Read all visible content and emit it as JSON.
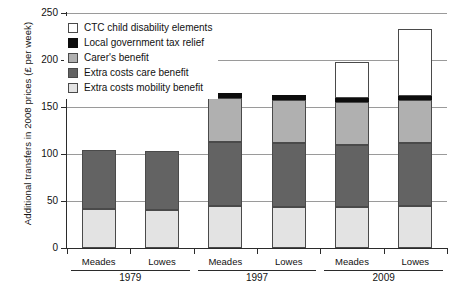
{
  "chart_data": {
    "type": "bar",
    "subtype": "stacked-bar-grouped",
    "title": "",
    "xlabel": "",
    "ylabel": "Additional transfers in 2008 prices (£ per week)",
    "ylim": [
      0,
      250
    ],
    "yticks": [
      0,
      50,
      100,
      150,
      200,
      250
    ],
    "ytick_labels": [
      "0",
      "50",
      "100",
      "150",
      "200",
      "250"
    ],
    "grid": true,
    "legend_position": "top-left-inside",
    "categories": [
      "Meades",
      "Lowes",
      "Meades",
      "Lowes",
      "Meades",
      "Lowes"
    ],
    "groups": [
      {
        "label": "1979",
        "categories": [
          "Meades",
          "Lowes"
        ]
      },
      {
        "label": "1997",
        "categories": [
          "Meades",
          "Lowes"
        ]
      },
      {
        "label": "2009",
        "categories": [
          "Meades",
          "Lowes"
        ]
      }
    ],
    "series": [
      {
        "name": "Extra costs mobility benefit",
        "color": "#e3e3e3",
        "values": [
          42,
          41,
          45,
          44,
          44,
          45
        ]
      },
      {
        "name": "Extra costs care benefit",
        "color": "#636363",
        "values": [
          62,
          62,
          68,
          68,
          66,
          67
        ]
      },
      {
        "name": "Carer's benefit",
        "color": "#b0b0b0",
        "values": [
          0,
          0,
          47,
          46,
          45,
          45
        ]
      },
      {
        "name": "Local government tax relief",
        "color": "#0d0d0d",
        "values": [
          0,
          0,
          5,
          5,
          5,
          5
        ]
      },
      {
        "name": "CTC child disability elements",
        "color": "#ffffff",
        "values": [
          0,
          0,
          0,
          0,
          38,
          71
        ]
      }
    ],
    "totals": [
      104,
      103,
      165,
      163,
      198,
      233
    ],
    "bars": [
      {
        "group": "1979",
        "category": "Meades",
        "total": 104,
        "segments": [
          {
            "name": "Extra costs mobility benefit",
            "value": 42,
            "from": 0,
            "to": 42
          },
          {
            "name": "Extra costs care benefit",
            "value": 62,
            "from": 42,
            "to": 104
          }
        ]
      },
      {
        "group": "1979",
        "category": "Lowes",
        "total": 103,
        "segments": [
          {
            "name": "Extra costs mobility benefit",
            "value": 41,
            "from": 0,
            "to": 41
          },
          {
            "name": "Extra costs care benefit",
            "value": 62,
            "from": 41,
            "to": 103
          }
        ]
      },
      {
        "group": "1997",
        "category": "Meades",
        "total": 165,
        "segments": [
          {
            "name": "Extra costs mobility benefit",
            "value": 45,
            "from": 0,
            "to": 45
          },
          {
            "name": "Extra costs care benefit",
            "value": 68,
            "from": 45,
            "to": 113
          },
          {
            "name": "Carer's benefit",
            "value": 47,
            "from": 113,
            "to": 160
          },
          {
            "name": "Local government tax relief",
            "value": 5,
            "from": 160,
            "to": 165
          }
        ]
      },
      {
        "group": "1997",
        "category": "Lowes",
        "total": 163,
        "segments": [
          {
            "name": "Extra costs mobility benefit",
            "value": 44,
            "from": 0,
            "to": 44
          },
          {
            "name": "Extra costs care benefit",
            "value": 68,
            "from": 44,
            "to": 112
          },
          {
            "name": "Carer's benefit",
            "value": 46,
            "from": 112,
            "to": 158
          },
          {
            "name": "Local government tax relief",
            "value": 5,
            "from": 158,
            "to": 163
          }
        ]
      },
      {
        "group": "2009",
        "category": "Meades",
        "total": 198,
        "segments": [
          {
            "name": "Extra costs mobility benefit",
            "value": 44,
            "from": 0,
            "to": 44
          },
          {
            "name": "Extra costs care benefit",
            "value": 66,
            "from": 44,
            "to": 110
          },
          {
            "name": "Carer's benefit",
            "value": 45,
            "from": 110,
            "to": 155
          },
          {
            "name": "Local government tax relief",
            "value": 5,
            "from": 155,
            "to": 160
          },
          {
            "name": "CTC child disability elements",
            "value": 38,
            "from": 160,
            "to": 198
          }
        ]
      },
      {
        "group": "2009",
        "category": "Lowes",
        "total": 233,
        "segments": [
          {
            "name": "Extra costs mobility benefit",
            "value": 45,
            "from": 0,
            "to": 45
          },
          {
            "name": "Extra costs care benefit",
            "value": 67,
            "from": 45,
            "to": 112
          },
          {
            "name": "Carer's benefit",
            "value": 45,
            "from": 112,
            "to": 157
          },
          {
            "name": "Local government tax relief",
            "value": 5,
            "from": 157,
            "to": 162
          },
          {
            "name": "CTC child disability elements",
            "value": 71,
            "from": 162,
            "to": 233
          }
        ]
      }
    ],
    "legend": [
      {
        "label": "CTC child disability elements",
        "color": "#ffffff",
        "key": "ctc"
      },
      {
        "label": "Local government tax relief",
        "color": "#0d0d0d",
        "key": "taxrelief"
      },
      {
        "label": "Carer's benefit",
        "color": "#b0b0b0",
        "key": "carer"
      },
      {
        "label": "Extra costs care benefit",
        "color": "#636363",
        "key": "care"
      },
      {
        "label": "Extra costs mobility benefit",
        "color": "#e3e3e3",
        "key": "mobility"
      }
    ]
  }
}
